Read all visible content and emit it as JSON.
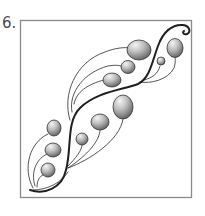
{
  "step": {
    "label": "6."
  },
  "illustration": {
    "description": "Tangle pattern: S-curve stem with shaded seed-pod balls",
    "stroke_color": "#222222",
    "frame_color": "#8a8a8a",
    "ball_light": "#f2f2f2",
    "ball_dark": "#6e6e6e",
    "ball_count": 11
  }
}
